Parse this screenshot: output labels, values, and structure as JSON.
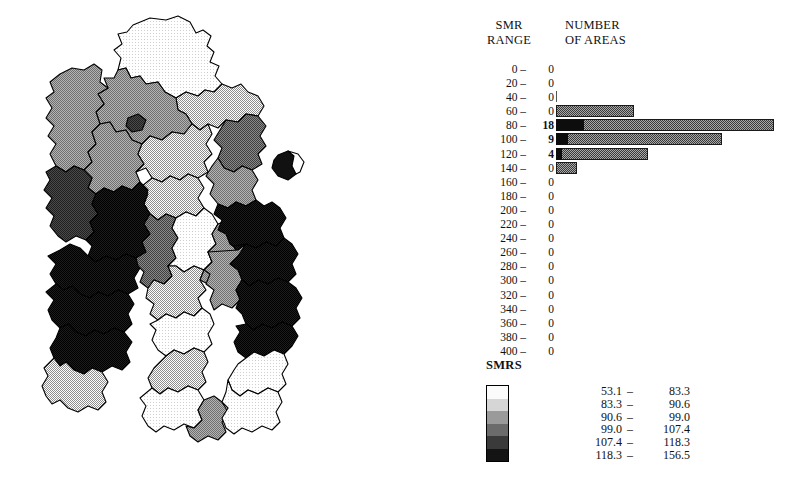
{
  "histogram": {
    "header": {
      "smr_line1": "SMR",
      "smr_line2": "RANGE",
      "num_line1": "NUMBER",
      "num_line2": "OF AREAS"
    },
    "rows": [
      {
        "range": "0 –",
        "count": "0"
      },
      {
        "range": "20 –",
        "count": "0"
      },
      {
        "range": "40 –",
        "count": "0"
      },
      {
        "range": "60 –",
        "count": "0"
      },
      {
        "range": "80 –",
        "count": "18"
      },
      {
        "range": "100 –",
        "count": "9"
      },
      {
        "range": "120 –",
        "count": "4"
      },
      {
        "range": "140 –",
        "count": "0"
      },
      {
        "range": "160 –",
        "count": "0"
      },
      {
        "range": "180 –",
        "count": "0"
      },
      {
        "range": "200 –",
        "count": "0"
      },
      {
        "range": "220 –",
        "count": "0"
      },
      {
        "range": "240 –",
        "count": "0"
      },
      {
        "range": "260 –",
        "count": "0"
      },
      {
        "range": "280 –",
        "count": "0"
      },
      {
        "range": "300 –",
        "count": "0"
      },
      {
        "range": "320 –",
        "count": "0"
      },
      {
        "range": "340 –",
        "count": "0"
      },
      {
        "range": "360 –",
        "count": "0"
      },
      {
        "range": "380 –",
        "count": "0"
      },
      {
        "range": "400 –",
        "count": "0"
      }
    ]
  },
  "legend": {
    "title": "SMRS",
    "classes": [
      {
        "low": "53.1",
        "dash": "–",
        "high": "83.3",
        "color": "#fbfbfb"
      },
      {
        "low": "83.3",
        "dash": "–",
        "high": "90.6",
        "color": "#d6d6d6"
      },
      {
        "low": "90.6",
        "dash": "–",
        "high": "99.0",
        "color": "#9a9a9a"
      },
      {
        "low": "99.0",
        "dash": "–",
        "high": "107.4",
        "color": "#6b6b6b"
      },
      {
        "low": "107.4",
        "dash": "–",
        "high": "118.3",
        "color": "#3a3a3a"
      },
      {
        "low": "118.3",
        "dash": "–",
        "high": "156.5",
        "color": "#141414"
      }
    ]
  },
  "chart_data": {
    "type": "bar",
    "title": "",
    "orientation": "horizontal",
    "xlabel": "NUMBER OF AREAS",
    "ylabel": "SMR RANGE",
    "grid": false,
    "legend_position": "below",
    "categories": [
      "0 –",
      "20 –",
      "40 –",
      "60 –",
      "80 –",
      "100 –",
      "120 –",
      "140 –",
      "160 –",
      "180 –",
      "200 –",
      "220 –",
      "240 –",
      "260 –",
      "280 –",
      "300 –",
      "320 –",
      "340 –",
      "360 –",
      "380 –",
      "400 –"
    ],
    "values": [
      0,
      0,
      0,
      0,
      18,
      9,
      4,
      0,
      0,
      0,
      0,
      0,
      0,
      0,
      0,
      0,
      0,
      0,
      0,
      0,
      0
    ],
    "bar_pixel_widths": [
      0,
      0,
      1,
      78,
      218,
      166,
      92,
      21,
      0,
      0,
      0,
      0,
      0,
      0,
      0,
      0,
      0,
      0,
      0,
      0,
      0
    ],
    "bar_cap_pixel_widths": [
      0,
      0,
      0,
      0,
      28,
      12,
      6,
      0,
      0,
      0,
      0,
      0,
      0,
      0,
      0,
      0,
      0,
      0,
      0,
      0,
      0
    ],
    "xlim": [
      0,
      20
    ],
    "total_areas": 31,
    "map": {
      "type": "choropleth",
      "variable": "SMR",
      "class_count": 6,
      "class_breaks": [
        53.1,
        83.3,
        90.6,
        99.0,
        107.4,
        118.3,
        156.5
      ]
    }
  },
  "map": {
    "regions": [
      {
        "name": "region-n1",
        "class": 1,
        "path": "M133,25 L150,18 L166,20 L178,16 L190,22 L196,33 L203,30 L211,36 L207,46 L214,52 L210,62 L219,66 L215,76 L222,84 L214,92 L205,90 L198,96 L186,92 L176,98 L165,92 L158,82 L146,84 L140,76 L131,78 L126,68 L118,70 L121,58 L114,50 L122,44 L118,34 L127,32 Z"
      },
      {
        "name": "region-n2",
        "class": 2,
        "path": "M186,92 L198,96 L205,90 L214,92 L222,84 L232,88 L241,84 L248,92 L258,96 L264,106 L258,116 L246,114 L238,122 L226,120 L218,128 L208,124 L200,130 L192,124 L186,114 L178,110 L176,98 Z"
      },
      {
        "name": "region-n3",
        "class": 3,
        "path": "M118,70 L126,68 L131,78 L140,76 L146,84 L158,82 L165,92 L176,98 L178,110 L186,114 L192,124 L184,134 L172,132 L162,140 L150,136 L142,144 L132,140 L126,130 L116,132 L110,122 L100,124 L96,112 L104,104 L98,94 L108,88 L104,78 L114,78 Z"
      },
      {
        "name": "region-n4",
        "class": 5,
        "path": "M128,118 L138,114 L146,120 L142,130 L132,132 L126,126 Z"
      },
      {
        "name": "region-w1",
        "class": 3,
        "path": "M60,74 L72,68 L84,70 L94,64 L102,70 L100,82 L108,88 L98,94 L104,104 L96,112 L100,124 L92,132 L96,144 L88,152 L92,162 L84,170 L74,166 L66,172 L56,166 L50,154 L56,144 L48,136 L54,126 L46,118 L52,108 L46,98 L54,92 L50,82 Z"
      },
      {
        "name": "region-c1",
        "class": 3,
        "path": "M100,124 L110,122 L116,132 L126,130 L132,140 L142,144 L138,154 L144,164 L136,172 L140,182 L132,190 L122,186 L114,192 L104,188 L96,194 L88,188 L92,178 L84,170 L92,162 L88,152 L96,144 L92,132 Z"
      },
      {
        "name": "region-c2",
        "class": 2,
        "path": "M142,144 L150,136 L162,140 L172,132 L184,134 L192,124 L200,130 L208,124 L212,134 L206,144 L212,154 L204,162 L208,172 L198,178 L188,174 L180,180 L170,176 L162,182 L152,178 L146,168 L136,172 L144,164 L138,154 Z"
      },
      {
        "name": "region-c3",
        "class": 2,
        "path": "M152,178 L162,182 L170,176 L180,180 L188,174 L198,178 L204,188 L198,198 L204,208 L196,216 L186,212 L176,218 L166,214 L158,220 L150,214 L144,204 L148,194 L142,186 Z"
      },
      {
        "name": "region-e1",
        "class": 4,
        "path": "M226,120 L238,122 L246,114 L258,116 L266,126 L260,136 L266,146 L258,154 L262,164 L252,170 L242,166 L234,172 L224,168 L218,158 L222,148 L214,140 L220,130 Z"
      },
      {
        "name": "region-e2",
        "class": 3,
        "path": "M218,158 L224,168 L234,172 L242,166 L252,170 L258,180 L252,190 L256,200 L246,206 L236,202 L228,208 L218,204 L210,194 L214,184 L206,176 L212,166 Z"
      },
      {
        "name": "region-w2",
        "class": 5,
        "path": "M56,166 L66,172 L74,166 L84,170 L92,178 L88,188 L96,194 L92,204 L98,214 L90,222 L94,232 L86,240 L76,236 L66,242 L58,236 L50,226 L54,216 L46,208 L52,198 L44,190 L50,180 L46,172 Z"
      },
      {
        "name": "region-w3",
        "class": 6,
        "path": "M86,240 L94,232 L90,222 L98,214 L92,204 L96,194 L104,188 L114,192 L122,186 L132,190 L140,182 L148,190 L144,204 L150,214 L144,224 L150,234 L142,242 L146,252 L136,258 L126,254 L116,260 L106,256 L96,262 L88,256 L92,246 Z"
      },
      {
        "name": "region-w4",
        "class": 6,
        "path": "M60,250 L70,244 L80,248 L88,256 L96,262 L106,256 L116,260 L126,254 L136,258 L140,268 L134,278 L138,288 L128,294 L118,290 L108,296 L98,292 L90,298 L80,294 L72,286 L64,290 L56,284 L50,274 L56,264 L48,256 Z"
      },
      {
        "name": "region-w5",
        "class": 6,
        "path": "M56,284 L64,290 L72,286 L80,294 L90,298 L98,292 L108,296 L118,290 L128,294 L134,304 L128,314 L132,324 L124,332 L114,328 L104,334 L94,330 L86,336 L76,332 L68,324 L60,328 L52,320 L48,310 L54,300 L46,292 Z"
      },
      {
        "name": "region-w6",
        "class": 6,
        "path": "M60,328 L68,324 L76,332 L86,336 L94,330 L104,334 L114,328 L124,332 L132,342 L126,352 L130,362 L122,370 L112,366 L102,372 L92,368 L84,374 L74,370 L66,362 L60,366 L54,358 L50,348 L56,338 Z"
      },
      {
        "name": "region-w7",
        "class": 2,
        "path": "M54,358 L60,366 L66,362 L74,370 L84,374 L92,368 L102,372 L108,382 L102,392 L106,402 L98,410 L88,406 L78,412 L68,408 L60,400 L52,404 L46,396 L42,386 L48,376 L44,368 Z"
      },
      {
        "name": "region-c4",
        "class": 4,
        "path": "M136,258 L146,252 L142,242 L150,234 L144,224 L150,214 L158,220 L166,214 L176,218 L172,228 L178,238 L172,248 L176,258 L168,266 L172,276 L164,284 L154,280 L148,288 L140,282 L144,272 L138,266 Z"
      },
      {
        "name": "region-c5",
        "class": 1,
        "path": "M172,248 L178,238 L172,228 L176,218 L186,212 L196,216 L204,208 L212,214 L218,224 L212,234 L216,244 L208,252 L212,262 L204,270 L194,266 L184,272 L176,266 L168,266 L176,258 Z"
      },
      {
        "name": "region-c6",
        "class": 2,
        "path": "M148,288 L154,280 L164,284 L172,276 L168,266 L176,266 L184,272 L194,266 L204,270 L200,280 L206,290 L198,298 L202,308 L194,316 L184,312 L176,318 L166,314 L158,320 L150,314 L154,304 L146,298 Z"
      },
      {
        "name": "region-c7",
        "class": 1,
        "path": "M158,320 L166,314 L176,318 L184,312 L194,316 L202,308 L210,314 L214,324 L208,334 L212,344 L204,352 L194,348 L184,354 L174,350 L166,356 L158,350 L152,340 L156,330 L150,324 Z"
      },
      {
        "name": "region-c8",
        "class": 3,
        "path": "M204,270 L212,262 L208,252 L216,244 L212,234 L218,224 L228,220 L236,226 L240,236 L234,246 L238,256 L230,264 L234,274 L226,282 L216,278 L208,284 L200,280 Z"
      },
      {
        "name": "region-e3",
        "class": 6,
        "path": "M218,204 L228,208 L236,202 L246,206 L256,200 L264,206 L272,202 L280,208 L286,218 L280,228 L284,238 L276,246 L266,242 L256,248 L246,244 L238,250 L230,244 L226,234 L218,230 L222,220 L214,214 Z"
      },
      {
        "name": "region-e4",
        "class": 6,
        "path": "M246,244 L256,248 L266,242 L276,246 L284,238 L292,244 L298,254 L292,264 L296,274 L288,282 L278,278 L268,284 L258,280 L250,286 L242,280 L238,270 L230,264 L238,256 L234,246 Z"
      },
      {
        "name": "region-e5",
        "class": 3,
        "path": "M238,250 L246,244 L238,256 L230,264 L238,270 L242,280 L236,290 L240,300 L232,308 L222,304 L214,310 L210,300 L214,290 L206,284 L210,274 L204,270 L212,262 L208,252 Z"
      },
      {
        "name": "region-e6",
        "class": 6,
        "path": "M250,286 L258,280 L268,284 L278,278 L288,282 L296,288 L302,298 L296,308 L300,318 L292,326 L282,322 L272,328 L262,324 L254,330 L246,324 L242,314 L236,308 L240,298 L236,290 L242,280 Z"
      },
      {
        "name": "region-e7",
        "class": 6,
        "path": "M246,324 L254,330 L262,324 L272,328 L282,322 L292,326 L298,336 L292,346 L284,354 L274,350 L264,356 L254,352 L246,358 L238,352 L234,342 L240,332 L236,326 Z"
      },
      {
        "name": "region-s1",
        "class": 1,
        "path": "M246,358 L254,352 L264,356 L274,350 L284,354 L288,364 L282,374 L286,384 L278,392 L268,388 L258,394 L248,390 L240,396 L232,390 L228,380 L234,370 L238,364 Z"
      },
      {
        "name": "region-s2",
        "class": 2,
        "path": "M166,356 L174,350 L184,354 L194,348 L204,352 L208,362 L202,372 L206,382 L198,390 L188,386 L178,392 L168,388 L160,394 L152,388 L148,378 L154,368 L160,362 Z"
      },
      {
        "name": "region-s3",
        "class": 1,
        "path": "M152,388 L160,394 L168,388 L178,392 L188,386 L198,390 L204,400 L198,410 L202,420 L194,428 L184,424 L174,430 L164,426 L156,432 L148,426 L142,416 L146,406 L140,398 Z"
      },
      {
        "name": "region-s4",
        "class": 3,
        "path": "M194,428 L202,420 L198,410 L204,400 L214,396 L222,402 L228,412 L222,422 L226,432 L218,440 L208,436 L198,442 L190,436 L186,426 Z"
      },
      {
        "name": "region-s5",
        "class": 1,
        "path": "M228,380 L232,390 L240,396 L248,390 L258,394 L268,388 L278,392 L282,402 L276,412 L280,422 L272,430 L262,426 L252,432 L242,428 L234,434 L226,428 L222,418 L228,408 L222,402 L226,392 Z"
      }
    ],
    "inset": {
      "name": "map-inset",
      "dark_path": "M278,155 L288,151 L294,156 L292,166 L296,174 L288,180 L278,176 L272,168 L274,160 Z",
      "light_path": "M288,151 L298,154 L304,162 L300,172 L296,174 L292,166 L294,156 Z"
    }
  }
}
